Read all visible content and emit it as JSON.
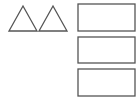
{
  "diagram": {
    "stroke_color": "#555555",
    "background": "#ffffff",
    "triangles": [
      {
        "name": "triangle-1"
      },
      {
        "name": "triangle-2"
      }
    ],
    "rectangles": [
      {
        "name": "rectangle-1"
      },
      {
        "name": "rectangle-2"
      },
      {
        "name": "rectangle-3"
      }
    ]
  }
}
